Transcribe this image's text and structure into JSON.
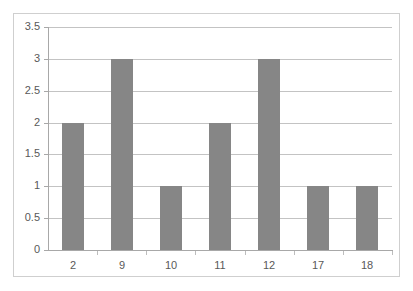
{
  "chart_data": {
    "type": "bar",
    "title": "",
    "subtitle": "",
    "xlabel": "",
    "ylabel": "",
    "categories": [
      "2",
      "9",
      "10",
      "11",
      "12",
      "17",
      "18"
    ],
    "values": [
      2,
      3,
      1,
      2,
      3,
      1,
      1
    ],
    "series": [
      {
        "name": "",
        "values": [
          2,
          3,
          1,
          2,
          3,
          1,
          1
        ]
      }
    ],
    "ylim": [
      0,
      3.5
    ],
    "ytick_labels": [
      "3.5",
      "3",
      "2.5",
      "2",
      "1.5",
      "1",
      "0.5",
      "0"
    ],
    "ytick_values": [
      3.5,
      3,
      2.5,
      2,
      1.5,
      1,
      0.5,
      0
    ],
    "grid": "horizontal",
    "legend": "none",
    "colors": {
      "bar_fill": "#868686",
      "gridline": "#c3c3c3",
      "axis_line": "#a8a8a8",
      "frame_border": "#cfcfcf",
      "tick_label": "#595959",
      "plot_background": "#ffffff"
    }
  }
}
